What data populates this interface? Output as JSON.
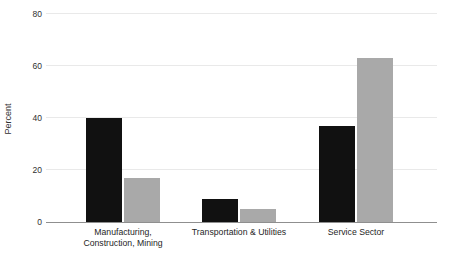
{
  "chart_data": {
    "type": "bar",
    "title": "",
    "xlabel": "",
    "ylabel": "Percent",
    "ylim": [
      0,
      80
    ],
    "yticks": [
      0,
      20,
      40,
      60,
      80
    ],
    "grid": "horizontal-light-lines-at-yticks",
    "legend": "none",
    "categories": [
      "Manufacturing, Construction, Mining",
      "Transportation & Utilities",
      "Service Sector"
    ],
    "category_label_lines": [
      [
        "Manufacturing,",
        "Construction, Mining"
      ],
      [
        "Transportation & Utilities"
      ],
      [
        "Service Sector"
      ]
    ],
    "series": [
      {
        "name": "dark-bars",
        "color": "#111111",
        "values": [
          40,
          9,
          37
        ]
      },
      {
        "name": "gray-bars",
        "color": "#a9a9a9",
        "values": [
          17,
          5,
          63
        ]
      }
    ]
  },
  "colors": {
    "background": "#ffffff",
    "bar_dark": "#111111",
    "bar_gray": "#a9a9a9",
    "gridline": "#e9e9e9",
    "axis_line": "#8f8f8f",
    "text": "#303030"
  }
}
